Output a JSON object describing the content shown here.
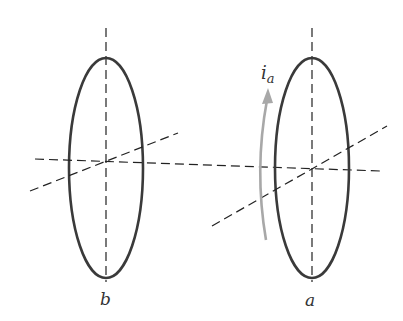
{
  "diagram": {
    "coils": [
      {
        "id": "b",
        "label": "b",
        "center": [
          106,
          168
        ],
        "rx": 37,
        "ry": 110
      },
      {
        "id": "a",
        "label": "a",
        "center": [
          312,
          168
        ],
        "rx": 37,
        "ry": 110
      }
    ],
    "current": {
      "symbol": "i",
      "subscript": "a",
      "color": "#a8a8a8",
      "direction": "up"
    },
    "colors": {
      "coil": "#3a3a3a",
      "axis": "#222222",
      "arrow": "#a8a8a8"
    }
  }
}
